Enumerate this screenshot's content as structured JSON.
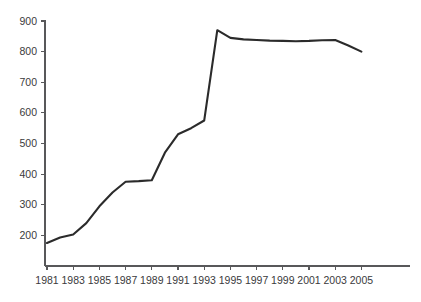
{
  "chart_data": {
    "type": "line",
    "title": "",
    "subtitle": "",
    "xlabel": "",
    "ylabel": "",
    "grid": false,
    "legend": false,
    "legend_position": "none",
    "xlim": [
      1980.5,
      2005.8
    ],
    "ylim": [
      100,
      900
    ],
    "x_tick_labels": [
      "1981",
      "1983",
      "1985",
      "1987",
      "1989",
      "1991",
      "1993",
      "1995",
      "1997",
      "1999",
      "2001",
      "2003",
      "2005"
    ],
    "x_tick_values": [
      1981,
      1983,
      1985,
      1987,
      1989,
      1991,
      1993,
      1995,
      1997,
      1999,
      2001,
      2003,
      2005
    ],
    "y_tick_labels": [
      "200",
      "300",
      "400",
      "500",
      "600",
      "700",
      "800",
      "900"
    ],
    "y_tick_values": [
      200,
      300,
      400,
      500,
      600,
      700,
      800,
      900
    ],
    "y_axis_min_tick": 100,
    "series": [
      {
        "name": "value",
        "color": "#2b2b2b",
        "x": [
          1981,
          1982,
          1983,
          1984,
          1985,
          1986,
          1987,
          1988,
          1989,
          1990,
          1991,
          1992,
          1993,
          1994,
          1995,
          1996,
          1997,
          1998,
          1999,
          2000,
          2001,
          2002,
          2003,
          2004,
          2005
        ],
        "values": [
          175,
          193,
          203,
          240,
          295,
          340,
          375,
          377,
          380,
          470,
          530,
          550,
          575,
          870,
          845,
          840,
          838,
          836,
          835,
          834,
          835,
          837,
          838,
          820,
          800
        ]
      }
    ]
  },
  "axes": {
    "axis_color": "#58585a",
    "tick_label_color": "#3a3a3c",
    "background": "#ffffff"
  }
}
